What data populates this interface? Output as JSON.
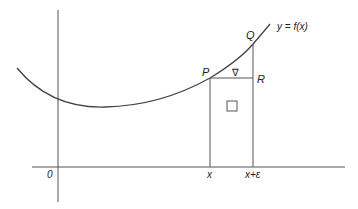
{
  "diagram": {
    "type": "calculus-function-increment",
    "colors": {
      "line": "#555555",
      "curve": "#444444",
      "text": "#222222",
      "background": "#ffffff"
    },
    "labels": {
      "function": "y = f(x)",
      "point_p": "P",
      "point_q": "Q",
      "point_r": "R",
      "origin": "0",
      "x_tick": "x",
      "x_eps_tick": "x+ε",
      "triangle_symbol": "∇",
      "rect_symbol": "□"
    }
  }
}
